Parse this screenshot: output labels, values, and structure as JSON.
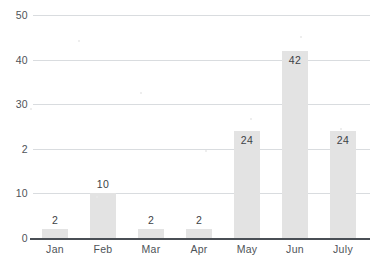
{
  "chart_data": {
    "type": "bar",
    "title": "",
    "xlabel": "",
    "ylabel": "",
    "categories": [
      "Jan",
      "Feb",
      "Mar",
      "Apr",
      "May",
      "Jun",
      "July"
    ],
    "values": [
      2,
      10,
      2,
      2,
      24,
      42,
      24
    ],
    "data_labels": [
      "2",
      "10",
      "2",
      "2",
      "24",
      "42",
      "24"
    ],
    "ylim": [
      0,
      50
    ],
    "yticks": [
      0,
      10,
      20,
      30,
      40,
      50
    ],
    "ytick_labels": [
      "0",
      "10",
      "2",
      "30",
      "40",
      "50"
    ],
    "grid": true,
    "legend": false,
    "bar_color": "#e3e3e3",
    "gridline_color": "#d9dcdf",
    "axis_color": "#4a4f55",
    "text_color": "#4e5358",
    "background": "#ffffff"
  }
}
